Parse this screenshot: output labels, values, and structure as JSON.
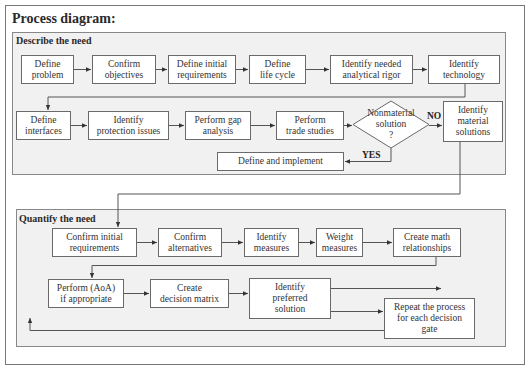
{
  "title": "Process diagram:",
  "sections": {
    "describe": {
      "label": "Describe the need",
      "row1": [
        {
          "text": "Define\nproblem"
        },
        {
          "text": "Confirm\nobjectives"
        },
        {
          "text": "Define initial\nrequirements"
        },
        {
          "text": "Define\nlife cycle"
        },
        {
          "text": "Identify needed\nanalytical rigor"
        },
        {
          "text": "Identify\ntechnology"
        }
      ],
      "row2": [
        {
          "text": "Define\ninterfaces"
        },
        {
          "text": "Identify\nprotection issues"
        },
        {
          "text": "Perform gap\nanalysis"
        },
        {
          "text": "Perform\ntrade studies"
        }
      ],
      "decision": {
        "text": "Nonmaterial\nsolution\n?"
      },
      "material": {
        "text": "Identify\nmaterial\nsolutions"
      },
      "implement": {
        "text": "Define and implement"
      },
      "no_label": "NO",
      "yes_label": "YES"
    },
    "quantify": {
      "label": "Quantify the need",
      "row1": [
        {
          "text": "Confirm initial\nrequirements"
        },
        {
          "text": "Confirm\nalternatives"
        },
        {
          "text": "Identify\nmeasures"
        },
        {
          "text": "Weight\nmeasures"
        },
        {
          "text": "Create math\nrelationships"
        }
      ],
      "row2": [
        {
          "text": "Perform (AoA)\nif appropriate"
        },
        {
          "text": "Create\ndecision matrix"
        },
        {
          "text": "Identify\npreferred\nsolution"
        }
      ],
      "repeat": {
        "text": "Repeat the process\nfor each decision\ngate"
      }
    }
  },
  "colors": {
    "section_fill": "#f1f1f1",
    "box_fill": "#ffffff",
    "line": "#555555"
  }
}
